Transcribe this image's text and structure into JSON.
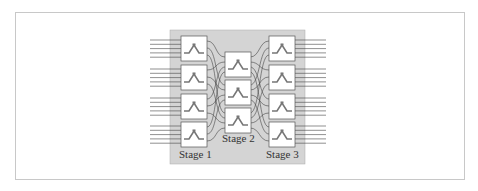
{
  "diagram": {
    "stages": [
      {
        "label": "Stage 1",
        "boxes": 4,
        "inputs_per_box": 5
      },
      {
        "label": "Stage 2",
        "boxes": 3
      },
      {
        "label": "Stage 3",
        "boxes": 4,
        "outputs_per_box": 5
      }
    ],
    "colors": {
      "panel": "#d4d4d4",
      "box": "#ffffff",
      "line": "#444444",
      "frame": "#c8c8c8"
    }
  }
}
